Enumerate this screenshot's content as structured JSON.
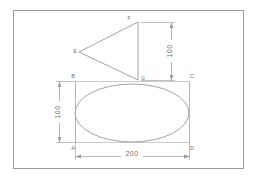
{
  "drawing": {
    "frame": {
      "name": "drawing-border",
      "color": "#9a9a9a"
    },
    "geometry_color": "#8a8a8a",
    "dimension_color": "#9a9a9a",
    "text_color": "#6d6d6d"
  },
  "shapes": {
    "ellipse": {
      "label": "ellipse",
      "cx": 132,
      "cy": 113,
      "rx": 57,
      "ry": 29
    },
    "triangle": {
      "label": "triangle",
      "points": "138,22 79,52 138,80"
    }
  },
  "corner_labels": {
    "bottom_left": "A",
    "top_left": "B",
    "top_right": "C",
    "bottom_right": "D"
  },
  "vertex_labels": {
    "apex": "F",
    "left": "E",
    "base": "G"
  },
  "dimensions": {
    "width": {
      "value": "200",
      "orientation": "horizontal",
      "name": "width-dimension"
    },
    "height_left": {
      "value": "100",
      "orientation": "vertical",
      "name": "ellipse-height-dimension"
    },
    "height_right": {
      "value": "100",
      "orientation": "vertical",
      "name": "triangle-height-dimension"
    }
  }
}
